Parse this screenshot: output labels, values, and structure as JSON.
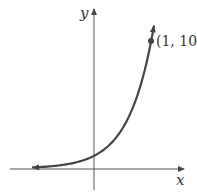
{
  "chart_data": {
    "type": "line",
    "title": "",
    "function": "y = 10^x",
    "xlabel": "x",
    "ylabel": "y",
    "series": [
      {
        "name": "exponential curve",
        "x": [
          -2,
          -1.5,
          -1,
          -0.5,
          0,
          0.25,
          0.5,
          0.75,
          1,
          1.07
        ],
        "values": [
          0.01,
          0.032,
          0.1,
          0.316,
          1,
          1.78,
          3.16,
          5.62,
          10,
          11.7
        ]
      }
    ],
    "annotations": [
      {
        "x": 1,
        "y": 10,
        "label": "(1, 10)"
      }
    ],
    "grid": false,
    "legend": "none",
    "xlim": [
      -1.5,
      1.6
    ],
    "ylim": [
      -1.7,
      12.7
    ]
  },
  "labels": {
    "x_axis": "x",
    "y_axis": "y",
    "point": "(1, 10)"
  },
  "colors": {
    "axis": "#444444",
    "curve": "#444444",
    "text": "#333333"
  }
}
